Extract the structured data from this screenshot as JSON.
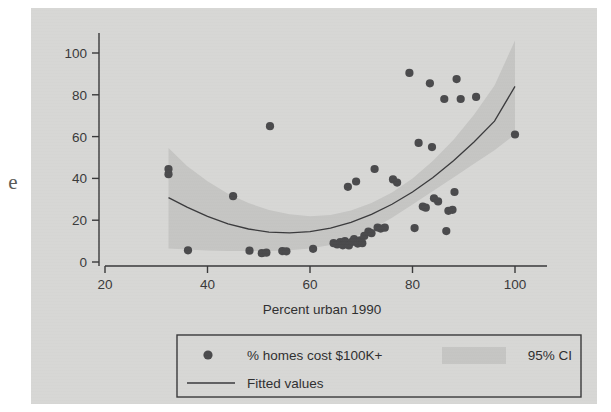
{
  "figure": {
    "page_edge_glyph": "e",
    "background_color": "#d7d7d5",
    "ink_color": "#39393a"
  },
  "chart_data": {
    "type": "scatter",
    "title": "",
    "xlabel": "Percent urban 1990",
    "ylabel": "",
    "xlim": [
      20,
      100
    ],
    "ylim": [
      0,
      100
    ],
    "xticks": [
      20,
      40,
      60,
      80,
      100
    ],
    "yticks": [
      0,
      20,
      40,
      60,
      80,
      100
    ],
    "xticklabels": [
      "20",
      "40",
      "60",
      "80",
      "100"
    ],
    "yticklabels": [
      "0",
      "20",
      "40",
      "60",
      "80",
      "100"
    ],
    "grid": false,
    "legend_position": "below-axes",
    "marker_color": "#4a4a4c",
    "line_color": "#3a3a3c",
    "band_color": "#c5c5c3",
    "series": [
      {
        "name": "% homes cost $100K+",
        "type": "scatter",
        "points": [
          [
            32.4,
            44.5
          ],
          [
            32.4,
            42.0
          ],
          [
            36.2,
            5.6
          ],
          [
            45.0,
            31.5
          ],
          [
            48.2,
            5.4
          ],
          [
            50.6,
            4.2
          ],
          [
            51.5,
            4.5
          ],
          [
            52.2,
            65.0
          ],
          [
            54.6,
            5.2
          ],
          [
            55.4,
            5.1
          ],
          [
            60.6,
            6.3
          ],
          [
            64.6,
            9.0
          ],
          [
            65.3,
            8.4
          ],
          [
            65.9,
            9.5
          ],
          [
            66.4,
            8.0
          ],
          [
            66.8,
            10.0
          ],
          [
            67.0,
            9.2
          ],
          [
            67.4,
            36.0
          ],
          [
            67.6,
            7.9
          ],
          [
            68.2,
            9.6
          ],
          [
            68.6,
            11.0
          ],
          [
            69.0,
            38.5
          ],
          [
            69.3,
            8.8
          ],
          [
            69.8,
            10.4
          ],
          [
            70.2,
            9.0
          ],
          [
            70.6,
            12.5
          ],
          [
            71.4,
            14.5
          ],
          [
            72.0,
            13.8
          ],
          [
            72.6,
            44.5
          ],
          [
            73.2,
            16.5
          ],
          [
            73.8,
            16.0
          ],
          [
            74.6,
            16.4
          ],
          [
            76.2,
            39.5
          ],
          [
            77.0,
            38.0
          ],
          [
            79.4,
            90.5
          ],
          [
            80.4,
            16.2
          ],
          [
            81.2,
            57.0
          ],
          [
            82.0,
            26.5
          ],
          [
            82.6,
            26.0
          ],
          [
            83.4,
            85.5
          ],
          [
            83.8,
            55.0
          ],
          [
            84.2,
            30.5
          ],
          [
            85.0,
            29.0
          ],
          [
            86.2,
            78.0
          ],
          [
            86.6,
            14.8
          ],
          [
            87.0,
            24.5
          ],
          [
            87.8,
            25.0
          ],
          [
            88.2,
            33.5
          ],
          [
            88.6,
            87.5
          ],
          [
            89.4,
            78.0
          ],
          [
            92.4,
            79.0
          ],
          [
            100.0,
            61.0
          ]
        ]
      },
      {
        "name": "Fitted values",
        "type": "line",
        "x": [
          32.4,
          36,
          40,
          44,
          48,
          52,
          56,
          60,
          64,
          68,
          72,
          76,
          80,
          84,
          88,
          92,
          96,
          100
        ],
        "y": [
          30.8,
          26.2,
          21.8,
          18.3,
          15.8,
          14.3,
          13.9,
          14.5,
          16.2,
          19.0,
          22.8,
          27.6,
          33.5,
          40.4,
          48.4,
          57.4,
          67.4,
          84.0
        ]
      },
      {
        "name": "95% CI",
        "type": "band",
        "x": [
          32.4,
          36,
          40,
          44,
          48,
          52,
          56,
          60,
          64,
          68,
          72,
          76,
          80,
          84,
          88,
          92,
          96,
          100
        ],
        "y_upper": [
          54.5,
          46.0,
          38.6,
          32.7,
          28.2,
          24.9,
          22.8,
          21.9,
          22.5,
          24.6,
          28.2,
          33.3,
          40.0,
          48.4,
          58.5,
          70.5,
          84.5,
          106.0
        ],
        "y_lower": [
          6.5,
          6.0,
          5.5,
          5.3,
          5.2,
          5.3,
          5.6,
          6.4,
          8.1,
          11.2,
          15.6,
          21.2,
          27.5,
          34.0,
          40.5,
          47.0,
          53.5,
          61.0
        ]
      }
    ],
    "legend": [
      {
        "label": "% homes cost $100K+",
        "marker": "circle"
      },
      {
        "label": "95% CI",
        "marker": "patch"
      },
      {
        "label": "Fitted values",
        "marker": "line"
      }
    ]
  }
}
